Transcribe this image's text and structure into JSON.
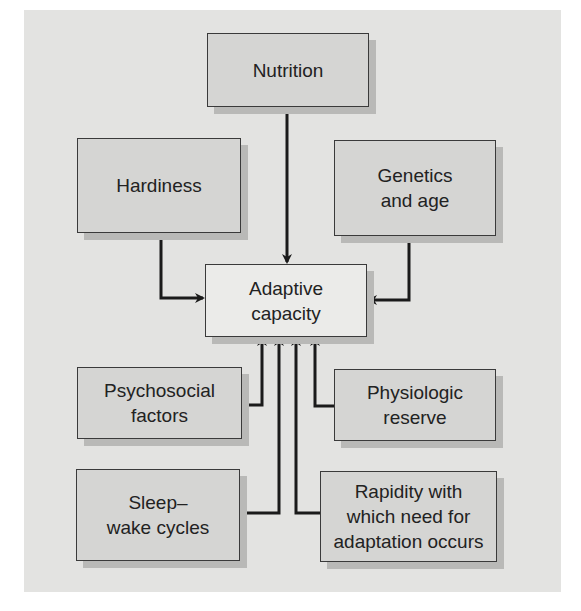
{
  "diagram": {
    "center": {
      "label": "Adaptive\ncapacity"
    },
    "factors": [
      {
        "id": "nutrition",
        "label": "Nutrition"
      },
      {
        "id": "hardiness",
        "label": "Hardiness"
      },
      {
        "id": "genetics",
        "label": "Genetics\nand age"
      },
      {
        "id": "psychosocial",
        "label": "Psychosocial\nfactors"
      },
      {
        "id": "physiologic",
        "label": "Physiologic\nreserve"
      },
      {
        "id": "sleep",
        "label": "Sleep–\nwake cycles"
      },
      {
        "id": "rapidity",
        "label": "Rapidity with\nwhich need for\nadaptation occurs"
      }
    ],
    "edges": [
      {
        "from": "nutrition",
        "to": "center"
      },
      {
        "from": "hardiness",
        "to": "center"
      },
      {
        "from": "genetics",
        "to": "center"
      },
      {
        "from": "psychosocial",
        "to": "center"
      },
      {
        "from": "physiologic",
        "to": "center"
      },
      {
        "from": "sleep",
        "to": "center"
      },
      {
        "from": "rapidity",
        "to": "center"
      }
    ],
    "colors": {
      "panel": "#e3e3e1",
      "box": "#d5d5d3",
      "center_box": "#ebebe9",
      "shadow": "#b9b9b7",
      "line": "#1a1a1a"
    }
  }
}
